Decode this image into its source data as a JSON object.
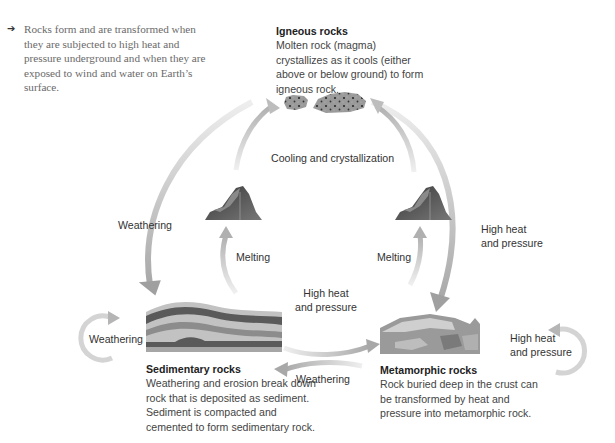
{
  "intro": {
    "bullet_icon": "arrow-right-icon",
    "text": "Rocks form and are transformed when they are subjected to high heat and pressure underground and when they are exposed to wind and water on Earth’s surface."
  },
  "nodes": {
    "igneous": {
      "title": "Igneous rocks",
      "description": "Molten rock (magma) crystallizes as it cools (either above or below ground) to form igneous rock."
    },
    "sedimentary": {
      "title": "Sedimentary rocks",
      "description": "Weathering and erosion break down rock that is deposited as sediment. Sediment is compacted and cemented to form sedimentary rock."
    },
    "metamorphic": {
      "title": "Metamorphic rocks",
      "description": "Rock buried deep in the crust can be transformed by heat and pressure into metamorphic rock."
    }
  },
  "labels": {
    "cooling": "Cooling and crystallization",
    "weathering_left_outer": "Weathering",
    "melting_left": "Melting",
    "melting_right": "Melting",
    "heat_pressure_right_outer_1": "High heat",
    "heat_pressure_right_outer_2": "and pressure",
    "heat_pressure_middle_1": "High heat",
    "heat_pressure_middle_2": "and pressure",
    "weathering_middle": "Weathering",
    "weathering_loop": "Weathering",
    "heat_pressure_loop_1": "High heat",
    "heat_pressure_loop_2": "and pressure"
  },
  "colors": {
    "arrow_light": "#ececec",
    "arrow_dark": "#b8b8b8",
    "rock_dark": "#555555",
    "rock_mid": "#8a8a8a",
    "rock_light": "#bdbdbd"
  }
}
